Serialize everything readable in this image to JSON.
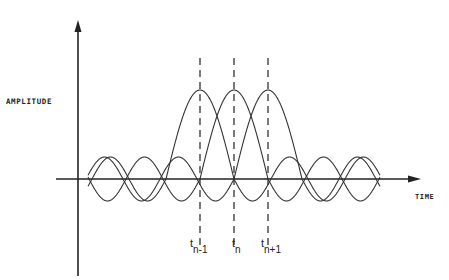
{
  "diagram": {
    "y_axis_label": "AMPLITUDE",
    "x_axis_label": "TIME",
    "markers": [
      {
        "base": "t",
        "subscript": "n-1",
        "x": 200
      },
      {
        "base": "t",
        "subscript": "n",
        "x": 234
      },
      {
        "base": "t",
        "subscript": "n+1",
        "x": 268
      }
    ],
    "line_color": "#222222"
  },
  "chart_data": {
    "type": "line",
    "title": "",
    "xlabel": "TIME",
    "ylabel": "AMPLITUDE",
    "x_ticks": [
      "t(n-1)",
      "t(n)",
      "t(n+1)"
    ],
    "series": [
      {
        "name": "pulse n-1",
        "center": "t(n-1)",
        "peak": 1.0,
        "sidelobe": 0.25
      },
      {
        "name": "pulse n",
        "center": "t(n)",
        "peak": 1.0,
        "sidelobe": 0.25
      },
      {
        "name": "pulse n+1",
        "center": "t(n+1)",
        "peak": 1.0,
        "sidelobe": 0.25
      }
    ],
    "grid": false,
    "legend": "none"
  }
}
